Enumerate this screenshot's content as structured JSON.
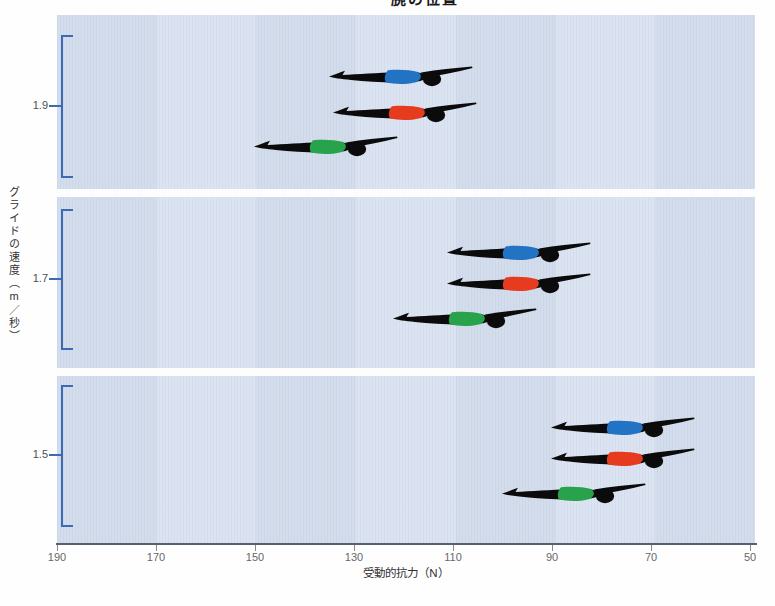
{
  "title": "腕の位置",
  "axes": {
    "x_label": "受動的抗力（N）",
    "y_label": "グライドの速度（m／秒）",
    "x_ticks": [
      "190",
      "170",
      "150",
      "130",
      "110",
      "90",
      "70",
      "50"
    ]
  },
  "colors": {
    "band_dark": "#d3ddec",
    "band_light": "#dce4f1",
    "bracket_blue": "#3d6ab2",
    "axis_line": "#55616f",
    "suit_blue": "#2273c4",
    "suit_red": "#e63b1e",
    "suit_green": "#28a34b",
    "silhouette": "#0b0b0b"
  },
  "chart_data": {
    "type": "scatter",
    "title": "腕の位置",
    "xlabel": "受動的抗力（N）",
    "ylabel": "グライドの速度（m／秒）",
    "x_range": [
      190,
      50
    ],
    "x_axis_reversed": true,
    "x_tick_values": [
      190,
      170,
      150,
      130,
      110,
      90,
      70,
      50
    ],
    "legend": "none (swimmer silhouettes with colored suits mark conditions)",
    "groups": [
      {
        "speed_label": "1.9",
        "speed_m_per_s": 1.9,
        "swimmers": [
          {
            "condition": "blue",
            "suit_hex": "#2273c4",
            "drag_N": 120
          },
          {
            "condition": "red",
            "suit_hex": "#e63b1e",
            "drag_N": 119
          },
          {
            "condition": "green",
            "suit_hex": "#28a34b",
            "drag_N": 135
          }
        ]
      },
      {
        "speed_label": "1.7",
        "speed_m_per_s": 1.7,
        "swimmers": [
          {
            "condition": "blue",
            "suit_hex": "#2273c4",
            "drag_N": 96
          },
          {
            "condition": "red",
            "suit_hex": "#e63b1e",
            "drag_N": 96
          },
          {
            "condition": "green",
            "suit_hex": "#28a34b",
            "drag_N": 107
          }
        ]
      },
      {
        "speed_label": "1.5",
        "speed_m_per_s": 1.5,
        "swimmers": [
          {
            "condition": "blue",
            "suit_hex": "#2273c4",
            "drag_N": 75
          },
          {
            "condition": "red",
            "suit_hex": "#e63b1e",
            "drag_N": 75
          },
          {
            "condition": "green",
            "suit_hex": "#28a34b",
            "drag_N": 85
          }
        ]
      }
    ]
  }
}
